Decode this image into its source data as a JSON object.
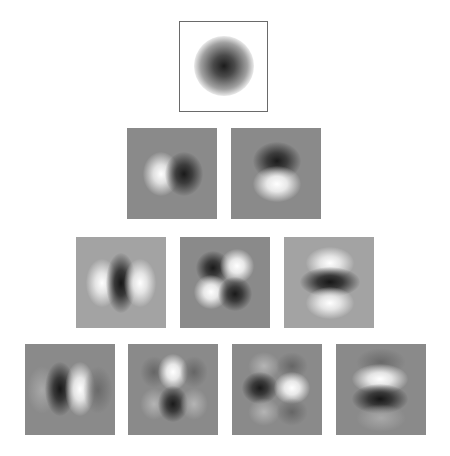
{
  "figure": {
    "rows": [
      {
        "order": 0,
        "tiles": [
          {
            "name": "gaussian-g",
            "bg": "white"
          }
        ]
      },
      {
        "order": 1,
        "tiles": [
          {
            "name": "dx",
            "bg": "gray"
          },
          {
            "name": "dy",
            "bg": "gray"
          }
        ]
      },
      {
        "order": 2,
        "tiles": [
          {
            "name": "dxx",
            "bg": "light"
          },
          {
            "name": "dxy",
            "bg": "gray"
          },
          {
            "name": "dyy",
            "bg": "light"
          }
        ]
      },
      {
        "order": 3,
        "tiles": [
          {
            "name": "dxxx",
            "bg": "gray"
          },
          {
            "name": "dxxy",
            "bg": "gray"
          },
          {
            "name": "dxyy",
            "bg": "gray"
          },
          {
            "name": "dyyy",
            "bg": "gray"
          }
        ]
      }
    ],
    "colors": {
      "gray": "#8a8a8a",
      "light": "#a3a3a3",
      "white": "#ffffff",
      "dark": "#1a1a1a",
      "bright": "#ffffff"
    }
  }
}
